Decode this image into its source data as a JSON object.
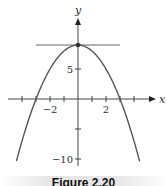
{
  "chart_data": {
    "type": "line",
    "title": "",
    "function": "y = 9 - x^2",
    "xlabel": "x",
    "ylabel": "y",
    "xlim": [
      -5.5,
      5.5
    ],
    "ylim": [
      -11,
      13
    ],
    "x_ticks": [
      -4,
      -3,
      -2,
      -1,
      0,
      1,
      2,
      3,
      4
    ],
    "x_tick_labels": [
      {
        "value": -2,
        "label": "−2"
      },
      {
        "value": 2,
        "label": "2"
      }
    ],
    "y_ticks": [
      -10,
      -5,
      5,
      9
    ],
    "y_tick_labels": [
      {
        "value": 5,
        "label": "5"
      },
      {
        "value": -10,
        "label": "−10"
      }
    ],
    "series": [
      {
        "name": "parabola",
        "x": [
          -4.4,
          -4,
          -3,
          -2,
          -1,
          0,
          1,
          2,
          3,
          4,
          4.4
        ],
        "y": [
          -10.36,
          -7,
          0,
          5,
          8,
          9,
          8,
          5,
          0,
          -7,
          -10.36
        ]
      },
      {
        "name": "horizontal tangent line",
        "x": [
          -3,
          3
        ],
        "y": [
          9,
          9
        ]
      }
    ],
    "annotations": [
      {
        "type": "point",
        "x": 0,
        "y": 9,
        "label": "vertex"
      }
    ],
    "grid": false,
    "legend": null
  },
  "caption": "Figure 2.20",
  "colors": {
    "curve": "#555555",
    "axes": "#444444",
    "tangent": "#666666"
  }
}
